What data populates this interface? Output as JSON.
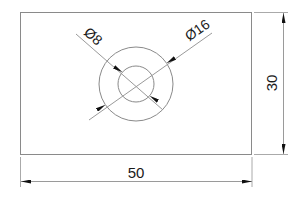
{
  "drawing": {
    "type": "technical-dimension-drawing",
    "part": {
      "shape": "rectangle",
      "width": 50,
      "height": 30
    },
    "holes": [
      {
        "label": "Ø8",
        "diameter": 8
      },
      {
        "label": "Ø16",
        "diameter": 16
      }
    ],
    "dimensions": {
      "width_label": "50",
      "height_label": "30",
      "inner_diameter_label": "Ø8",
      "outer_diameter_label": "Ø16"
    },
    "colors": {
      "outline": "#8a8a8a",
      "dimension_line": "#9a9a9a",
      "arrow": "#111111",
      "text": "#1a1a1a"
    }
  }
}
